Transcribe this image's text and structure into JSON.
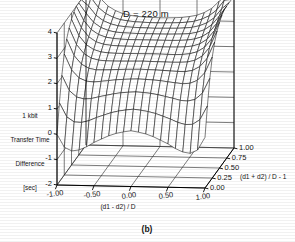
{
  "figure": {
    "title": "D = 220 m",
    "caption": "(b)",
    "caption_name": "subfigure-label"
  },
  "chart_data": {
    "type": "surface",
    "title": "D = 220 m",
    "xlabel": "(d1 - d2) / D",
    "ylabel": "(d1 + d2) / D - 1",
    "zlabel": "1 kbit\nTransfer Time\nDifference\n[sec]",
    "zlabel_lines": [
      "1 kbit",
      "Transfer Time",
      "Difference",
      "[sec]"
    ],
    "xticks": [
      "-1.00",
      "-0.50",
      "0.00",
      "0.50",
      "1.00"
    ],
    "xtick_values": [
      -1.0,
      -0.5,
      0.0,
      0.5,
      1.0
    ],
    "yticks": [
      "0.00",
      "0.25",
      "0.50",
      "0.75",
      "1.00"
    ],
    "ytick_values": [
      0.0,
      0.25,
      0.5,
      0.75,
      1.0
    ],
    "zticks": [
      "-2",
      "-1",
      "0",
      "1",
      "2",
      "3",
      "4"
    ],
    "ztick_values": [
      -2,
      -1,
      0,
      1,
      2,
      3,
      4
    ],
    "xlim": [
      -1.0,
      1.0
    ],
    "ylim": [
      0.0,
      1.0
    ],
    "zlim": [
      -2,
      4
    ],
    "grid": true,
    "legend": "none",
    "mesh_n_x": 21,
    "mesh_n_y": 13,
    "surface_color": "#000000",
    "line_color": "#000000",
    "z_grid": [
      [
        -2.0,
        -1.28,
        -0.72,
        -0.32,
        -0.05,
        0.12,
        0.2,
        0.12,
        -0.05,
        -0.32,
        -0.72,
        -1.28,
        -2.0
      ],
      [
        -0.8,
        -0.22,
        0.22,
        0.53,
        0.74,
        0.86,
        0.92,
        0.86,
        0.74,
        0.53,
        0.22,
        -0.22,
        -0.8
      ],
      [
        0.25,
        0.68,
        1.0,
        1.22,
        1.36,
        1.44,
        1.47,
        1.44,
        1.36,
        1.22,
        1.0,
        0.68,
        0.25
      ],
      [
        1.05,
        1.35,
        1.56,
        1.7,
        1.79,
        1.83,
        1.85,
        1.83,
        1.79,
        1.7,
        1.56,
        1.35,
        1.05
      ],
      [
        1.6,
        1.8,
        1.93,
        2.02,
        2.07,
        2.09,
        2.1,
        2.09,
        2.07,
        2.02,
        1.93,
        1.8,
        1.6
      ],
      [
        2.0,
        2.12,
        2.2,
        2.25,
        2.27,
        2.28,
        2.29,
        2.28,
        2.27,
        2.25,
        2.2,
        2.12,
        2.0
      ],
      [
        2.3,
        2.37,
        2.41,
        2.43,
        2.44,
        2.45,
        2.45,
        2.45,
        2.44,
        2.43,
        2.41,
        2.37,
        2.3
      ],
      [
        2.55,
        2.58,
        2.59,
        2.6,
        2.6,
        2.6,
        2.6,
        2.6,
        2.6,
        2.6,
        2.59,
        2.58,
        2.55
      ],
      [
        2.78,
        2.77,
        2.75,
        2.74,
        2.73,
        2.73,
        2.73,
        2.73,
        2.73,
        2.74,
        2.75,
        2.77,
        2.78
      ],
      [
        3.0,
        2.95,
        2.9,
        2.86,
        2.85,
        2.84,
        2.84,
        2.84,
        2.85,
        2.86,
        2.9,
        2.95,
        3.0
      ],
      [
        3.25,
        3.13,
        3.04,
        2.98,
        2.95,
        2.94,
        2.93,
        2.94,
        2.95,
        2.98,
        3.04,
        3.13,
        3.25
      ],
      [
        3.55,
        3.34,
        3.19,
        3.09,
        3.04,
        3.02,
        3.01,
        3.02,
        3.04,
        3.09,
        3.19,
        3.34,
        3.55
      ],
      [
        4.0,
        3.6,
        3.34,
        3.2,
        3.12,
        3.09,
        3.08,
        3.09,
        3.12,
        3.2,
        3.34,
        3.6,
        4.0
      ]
    ]
  }
}
